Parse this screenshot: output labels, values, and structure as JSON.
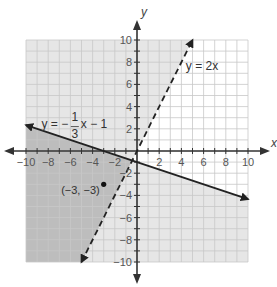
{
  "chart_data": {
    "type": "line",
    "title": "",
    "xlabel": "x",
    "ylabel": "y",
    "xlim": [
      -10,
      10
    ],
    "ylim": [
      -10,
      10
    ],
    "grid": true,
    "x_ticks": [
      -10,
      -8,
      -6,
      -4,
      -2,
      2,
      4,
      6,
      8,
      10
    ],
    "y_ticks": [
      10,
      8,
      6,
      4,
      2,
      -2,
      -4,
      -6,
      -8,
      -10
    ],
    "x_tick_labels": [
      "−10",
      "−8",
      "−6",
      "−4",
      "−2",
      "2",
      "4",
      "6",
      "8",
      "10"
    ],
    "y_tick_labels": [
      "10",
      "8",
      "6",
      "4",
      "2",
      "−2",
      "−4",
      "−6",
      "−8",
      "−10"
    ],
    "series": [
      {
        "name": "y = 2x",
        "label": "y = 2x",
        "slope": 2,
        "intercept": 0,
        "style": "dashed",
        "x_range": [
          -5,
          5
        ],
        "shading": "above"
      },
      {
        "name": "y = -1/3x - 1",
        "label_parts": {
          "lhs": "y = −",
          "num": "1",
          "den": "3",
          "rhs": "x − 1"
        },
        "slope": -0.3333,
        "intercept": -1,
        "style": "solid",
        "x_range": [
          -10,
          10
        ],
        "shading": "below"
      }
    ],
    "points": [
      {
        "x": -3,
        "y": -3,
        "label": "(−3, −3)"
      }
    ],
    "colors": {
      "grid": "#c8c8c8",
      "single_shade": "#e6e6e6",
      "overlap_shade": "#bdbdbd",
      "line": "#222222",
      "axis": "#333333"
    }
  }
}
